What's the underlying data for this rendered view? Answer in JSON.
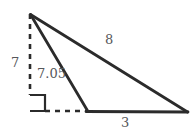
{
  "diagram": {
    "type": "triangle-with-altitude",
    "background_color": "#ffffff",
    "stroke_color": "#2b2b2b",
    "text_color": "#55575a",
    "labels": {
      "height": "7",
      "inner_hypotenuse": "7.05",
      "outer_hypotenuse": "8",
      "base": "3"
    },
    "points": {
      "apex": [
        30,
        14
      ],
      "foot": [
        30,
        111
      ],
      "inner_base": [
        88,
        111
      ],
      "right_vertex": [
        187,
        112
      ]
    },
    "segments": [
      {
        "name": "altitude",
        "style": "dashed",
        "from": "apex",
        "to": "foot",
        "label": "7"
      },
      {
        "name": "inner-slant",
        "style": "solid",
        "from": "apex",
        "to": "inner_base",
        "label": "7.05"
      },
      {
        "name": "outer-slant",
        "style": "solid",
        "from": "apex",
        "to": "right_vertex",
        "label": "8"
      },
      {
        "name": "base-dashed",
        "style": "dashed",
        "from": "foot",
        "to": "inner_base",
        "label": ""
      },
      {
        "name": "base-solid",
        "style": "solid",
        "from": "inner_base",
        "to": "right_vertex",
        "label": "3"
      }
    ],
    "right_angle_marker": {
      "x": 30,
      "y": 95,
      "size": 16
    }
  }
}
